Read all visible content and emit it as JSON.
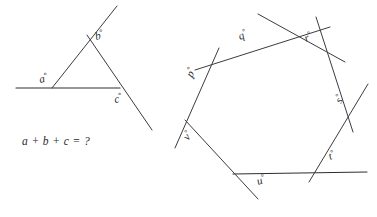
{
  "canvas": {
    "width": 377,
    "height": 217,
    "background": "#ffffff",
    "line_color": "#3b3b42",
    "text_color": "#2b2b30"
  },
  "figures": [
    {
      "id": "triangle-exterior-angles",
      "name": "Triangle with extended sides",
      "labels": [
        {
          "key": "a",
          "text": "a",
          "degree": "°",
          "x": 40,
          "y": 83,
          "rotate": -12
        },
        {
          "key": "b",
          "text": "b",
          "degree": "°",
          "x": 96,
          "y": 40,
          "rotate": -14
        },
        {
          "key": "c",
          "text": "c",
          "degree": "°",
          "x": 115,
          "y": 103,
          "rotate": -12
        }
      ],
      "equation": {
        "text": "a + b + c = ?",
        "terms": [
          "a",
          "b",
          "c"
        ],
        "operators": [
          "+",
          "+",
          "="
        ],
        "result": "?",
        "x": 22,
        "y": 145
      },
      "segments": [
        {
          "name": "baseline-extended",
          "x1": 16,
          "y1": 88,
          "x2": 120,
          "y2": 88
        },
        {
          "name": "left-side-extended",
          "x1": 52,
          "y1": 88,
          "x2": 117,
          "y2": 6
        },
        {
          "name": "right-side-extended",
          "x1": 87,
          "y1": 35,
          "x2": 152,
          "y2": 130
        }
      ],
      "vertices": [
        {
          "name": "vertex-a",
          "x": 52,
          "y": 88
        },
        {
          "name": "vertex-b",
          "x": 87,
          "y": 35
        },
        {
          "name": "vertex-c",
          "x": 118,
          "y": 88
        }
      ]
    },
    {
      "id": "heptagon-exterior-angles",
      "name": "Heptagon with extended sides",
      "labels": [
        {
          "key": "p",
          "text": "p",
          "degree": "°",
          "x": 192,
          "y": 78,
          "rotate": -62
        },
        {
          "key": "q",
          "text": "q",
          "degree": "°",
          "x": 240,
          "y": 40,
          "rotate": -22
        },
        {
          "key": "r",
          "text": "r",
          "degree": "°",
          "x": 306,
          "y": 42,
          "rotate": -22
        },
        {
          "key": "s",
          "text": "s",
          "degree": "°",
          "x": 341,
          "y": 104,
          "rotate": -62
        },
        {
          "key": "t",
          "text": "t",
          "degree": "°",
          "x": 330,
          "y": 160,
          "rotate": -20
        },
        {
          "key": "u",
          "text": "u",
          "degree": "°",
          "x": 258,
          "y": 185,
          "rotate": -18
        },
        {
          "key": "v",
          "text": "v",
          "degree": "°",
          "x": 188,
          "y": 141,
          "rotate": -52
        }
      ],
      "vertices": [
        {
          "name": "vertex-p",
          "x": 215,
          "y": 59
        },
        {
          "name": "vertex-q",
          "x": 277,
          "y": 40
        },
        {
          "name": "vertex-r",
          "x": 318,
          "y": 58
        },
        {
          "name": "vertex-s",
          "x": 345,
          "y": 122
        },
        {
          "name": "vertex-t",
          "x": 318,
          "y": 173
        },
        {
          "name": "vertex-u",
          "x": 242,
          "y": 174
        },
        {
          "name": "vertex-v",
          "x": 192,
          "y": 128
        }
      ],
      "segments": [
        {
          "name": "edge-pq-extended",
          "x1": 195,
          "y1": 70,
          "x2": 330,
          "y2": 27
        },
        {
          "name": "edge-qr-extended",
          "x1": 258,
          "y1": 14,
          "x2": 345,
          "y2": 62
        },
        {
          "name": "edge-rs-extended",
          "x1": 316,
          "y1": 17,
          "x2": 353,
          "y2": 132
        },
        {
          "name": "edge-st-extended",
          "x1": 368,
          "y1": 84,
          "x2": 309,
          "y2": 182
        },
        {
          "name": "edge-tu-extended",
          "x1": 367,
          "y1": 172,
          "x2": 233,
          "y2": 174
        },
        {
          "name": "edge-uv-extended",
          "x1": 258,
          "y1": 199,
          "x2": 185,
          "y2": 120
        },
        {
          "name": "edge-vp-extended",
          "x1": 175,
          "y1": 148,
          "x2": 219,
          "y2": 48
        }
      ]
    }
  ]
}
